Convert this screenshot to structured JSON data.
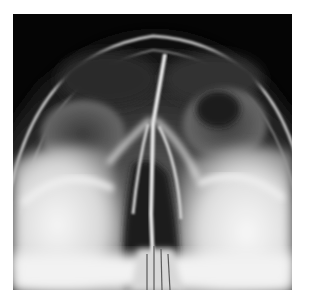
{
  "image": {
    "subject": "Sinus radiograph (occipitomental / Waters view)",
    "modality": "X-ray",
    "background_color": "#ffffff",
    "film_dark_color": "#050505",
    "bone_light_color": "#f4f4f4"
  }
}
